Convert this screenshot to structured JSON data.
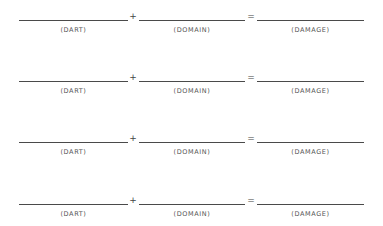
{
  "worksheet": {
    "operators": {
      "plus": "+",
      "equals": "="
    },
    "rows": [
      {
        "dart_label": "(DART)",
        "domain_label": "(DOMAIN)",
        "damage_label": "(DAMAGE)",
        "dart_value": "",
        "domain_value": "",
        "damage_value": ""
      },
      {
        "dart_label": "(DART)",
        "domain_label": "(DOMAIN)",
        "damage_label": "(DAMAGE)",
        "dart_value": "",
        "domain_value": "",
        "damage_value": ""
      },
      {
        "dart_label": "(DART)",
        "domain_label": "(DOMAIN)",
        "damage_label": "(DAMAGE)",
        "dart_value": "",
        "domain_value": "",
        "damage_value": ""
      },
      {
        "dart_label": "(DART)",
        "domain_label": "(DOMAIN)",
        "damage_label": "(DAMAGE)",
        "dart_value": "",
        "domain_value": "",
        "damage_value": ""
      }
    ]
  }
}
